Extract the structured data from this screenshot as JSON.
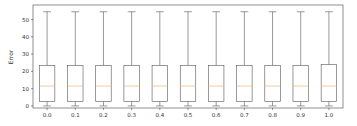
{
  "chart_data": {
    "type": "box",
    "title": "",
    "xlabel": "",
    "ylabel": "Error",
    "categories": [
      "0.0",
      "0.1",
      "0.2",
      "0.3",
      "0.4",
      "0.5",
      "0.6",
      "0.7",
      "0.8",
      "0.9",
      "1.0"
    ],
    "boxes": [
      {
        "label": "0.0",
        "whisker_low": 0,
        "q1": 2.5,
        "median": 11.5,
        "q3": 23.5,
        "whisker_high": 54.5
      },
      {
        "label": "0.1",
        "whisker_low": 0,
        "q1": 2.5,
        "median": 11.5,
        "q3": 23.5,
        "whisker_high": 54.5
      },
      {
        "label": "0.2",
        "whisker_low": 0,
        "q1": 2.5,
        "median": 11.5,
        "q3": 23.5,
        "whisker_high": 54.5
      },
      {
        "label": "0.3",
        "whisker_low": 0,
        "q1": 2.5,
        "median": 11.5,
        "q3": 23.5,
        "whisker_high": 54.5
      },
      {
        "label": "0.4",
        "whisker_low": 0,
        "q1": 2.5,
        "median": 11.5,
        "q3": 23.5,
        "whisker_high": 54.5
      },
      {
        "label": "0.5",
        "whisker_low": 0,
        "q1": 2.5,
        "median": 11.5,
        "q3": 23.5,
        "whisker_high": 54.5
      },
      {
        "label": "0.6",
        "whisker_low": 0,
        "q1": 2.5,
        "median": 11.5,
        "q3": 23.5,
        "whisker_high": 54.5
      },
      {
        "label": "0.7",
        "whisker_low": 0,
        "q1": 2.5,
        "median": 11.5,
        "q3": 23.5,
        "whisker_high": 54.5
      },
      {
        "label": "0.8",
        "whisker_low": 0,
        "q1": 2.5,
        "median": 11.5,
        "q3": 23.5,
        "whisker_high": 54.5
      },
      {
        "label": "0.9",
        "whisker_low": 0,
        "q1": 2.5,
        "median": 11.5,
        "q3": 23.5,
        "whisker_high": 54.5
      },
      {
        "label": "1.0",
        "whisker_low": 0,
        "q1": 2.5,
        "median": 11.5,
        "q3": 24.0,
        "whisker_high": 54.5
      }
    ],
    "yticks": [
      0,
      10,
      20,
      30,
      40,
      50
    ],
    "ylim": [
      -1.2,
      58.4
    ],
    "grid": false,
    "legend": null,
    "colors": {
      "box": "#555555",
      "median": "#f0b27a",
      "axis": "#444444"
    }
  }
}
